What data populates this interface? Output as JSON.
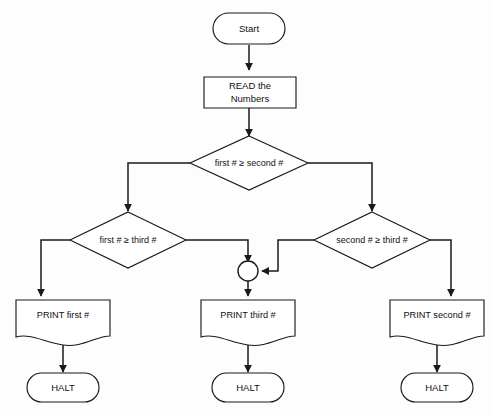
{
  "diagram": {
    "background_color": "#fdfdfd",
    "line_color": "#1a1a1a",
    "shape_fill": "#ffffff",
    "nodes": {
      "start": {
        "label": "Start",
        "shape": "terminator"
      },
      "read": {
        "label_line1": "READ the",
        "label_line2": "Numbers",
        "shape": "manual-input"
      },
      "decision_first_second": {
        "label": "first # ≥ second #",
        "shape": "decision"
      },
      "decision_first_third": {
        "label": "first # ≥ third #",
        "shape": "decision"
      },
      "decision_second_third": {
        "label": "second # ≥ third #",
        "shape": "decision"
      },
      "connector": {
        "label": "",
        "shape": "circle-connector"
      },
      "print_first": {
        "label": "PRINT first #",
        "shape": "document"
      },
      "print_third": {
        "label": "PRINT third #",
        "shape": "document"
      },
      "print_second": {
        "label": "PRINT second #",
        "shape": "document"
      },
      "halt_left": {
        "label": "HALT",
        "shape": "terminator"
      },
      "halt_center": {
        "label": "HALT",
        "shape": "terminator"
      },
      "halt_right": {
        "label": "HALT",
        "shape": "terminator"
      }
    },
    "edges": [
      {
        "from": "start",
        "to": "read"
      },
      {
        "from": "read",
        "to": "decision_first_second"
      },
      {
        "from": "decision_first_second",
        "to": "decision_first_third"
      },
      {
        "from": "decision_first_second",
        "to": "decision_second_third"
      },
      {
        "from": "decision_first_third",
        "to": "print_first"
      },
      {
        "from": "decision_first_third",
        "to": "connector"
      },
      {
        "from": "decision_second_third",
        "to": "connector"
      },
      {
        "from": "decision_second_third",
        "to": "print_second"
      },
      {
        "from": "connector",
        "to": "print_third"
      },
      {
        "from": "print_first",
        "to": "halt_left"
      },
      {
        "from": "print_third",
        "to": "halt_center"
      },
      {
        "from": "print_second",
        "to": "halt_right"
      }
    ]
  }
}
